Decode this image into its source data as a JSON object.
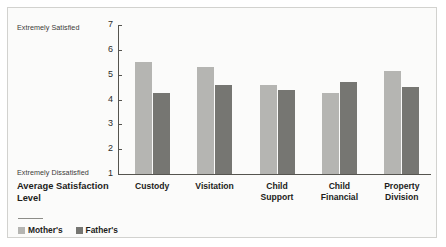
{
  "chart_data": {
    "type": "bar",
    "title": "",
    "xlabel": "Average Satisfaction Level",
    "ylabel": "",
    "ylim": [
      1,
      7
    ],
    "yticks": [
      1,
      2,
      3,
      4,
      5,
      6,
      7
    ],
    "grid": false,
    "legend_position": "bottom-left",
    "axis_annotations": {
      "y_max_label": "Extremely Satisfied",
      "y_min_label": "Extremely Dissatisfied"
    },
    "categories": [
      "Custody",
      "Visitation",
      "Child Support",
      "Child Financial",
      "Property Division"
    ],
    "category_lines": [
      [
        "Custody"
      ],
      [
        "Visitation"
      ],
      [
        "Child",
        "Support"
      ],
      [
        "Child",
        "Financial"
      ],
      [
        "Property",
        "Division"
      ]
    ],
    "series": [
      {
        "name": "Mother's",
        "color": "#b5b5b2",
        "values": [
          5.5,
          5.3,
          4.6,
          4.25,
          5.15
        ]
      },
      {
        "name": "Father's",
        "color": "#767672",
        "values": [
          4.25,
          4.6,
          4.4,
          4.7,
          4.5
        ]
      }
    ]
  },
  "legend": {
    "items": [
      {
        "label": "Mother's",
        "color": "#b5b5b2"
      },
      {
        "label": "Father's",
        "color": "#767672"
      }
    ]
  }
}
